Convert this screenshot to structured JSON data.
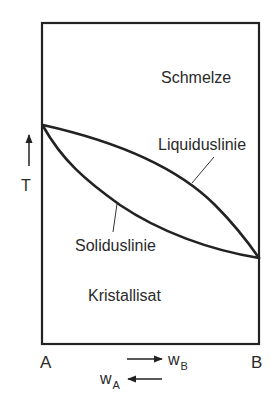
{
  "diagram": {
    "type": "binary-phase-diagram",
    "colors": {
      "line": "#222222",
      "text": "#2a2a2a",
      "background": "#ffffff"
    },
    "regions": {
      "liquid": "Schmelze",
      "solid": "Kristallisat"
    },
    "curves": {
      "liquidus": "Liquiduslinie",
      "solidus": "Soliduslinie"
    },
    "axes": {
      "y_label": "T",
      "y_arrow": "up",
      "x_left_component": "A",
      "x_right_component": "B",
      "composition_b": {
        "base": "w",
        "sub": "B",
        "arrow": "right"
      },
      "composition_a": {
        "base": "w",
        "sub": "A",
        "arrow": "left"
      }
    }
  }
}
